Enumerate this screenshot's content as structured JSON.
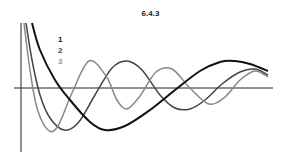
{
  "chart_data": {
    "type": "line",
    "title": "6.4.3",
    "xlabel": "",
    "ylabel": "",
    "grid": false,
    "legend_position": "upper-left (inside plot)",
    "axes": {
      "y_axis": {
        "x": 21,
        "y_top": 23,
        "y_bottom": 152
      },
      "x_axis": {
        "y": 88,
        "x_left": 14,
        "x_right": 273
      }
    },
    "series": [
      {
        "name": "1",
        "color": "#111111",
        "stroke_width": 2,
        "description": "decays from +inf near origin, one deep minimum, then broad positive hump",
        "points": [
          [
            32,
            23
          ],
          [
            40,
            50
          ],
          [
            55,
            80
          ],
          [
            70,
            100
          ],
          [
            90,
            122
          ],
          [
            105,
            130
          ],
          [
            125,
            126
          ],
          [
            150,
            110
          ],
          [
            175,
            90
          ],
          [
            200,
            71
          ],
          [
            220,
            62
          ],
          [
            235,
            61
          ],
          [
            250,
            64
          ],
          [
            268,
            71
          ]
        ]
      },
      {
        "name": "2",
        "color": "#444444",
        "stroke_width": 1.5,
        "description": "decays from +inf, minimum, then oscillates with decaying amplitude",
        "points": [
          [
            26,
            23
          ],
          [
            32,
            60
          ],
          [
            40,
            95
          ],
          [
            50,
            118
          ],
          [
            64,
            130
          ],
          [
            78,
            123
          ],
          [
            95,
            95
          ],
          [
            112,
            68
          ],
          [
            127,
            61
          ],
          [
            142,
            70
          ],
          [
            160,
            95
          ],
          [
            175,
            108
          ],
          [
            190,
            109
          ],
          [
            205,
            100
          ],
          [
            222,
            84
          ],
          [
            240,
            72
          ],
          [
            255,
            69
          ],
          [
            268,
            75
          ]
        ]
      },
      {
        "name": "3",
        "color": "#888888",
        "stroke_width": 1.5,
        "description": "fastest decay from +inf, highest oscillation frequency",
        "points": [
          [
            24,
            23
          ],
          [
            30,
            70
          ],
          [
            37,
            108
          ],
          [
            48,
            130
          ],
          [
            58,
            126
          ],
          [
            72,
            93
          ],
          [
            89,
            61
          ],
          [
            106,
            76
          ],
          [
            117,
            100
          ],
          [
            127,
            109
          ],
          [
            140,
            96
          ],
          [
            156,
            72
          ],
          [
            172,
            69
          ],
          [
            190,
            88
          ],
          [
            209,
            104
          ],
          [
            225,
            97
          ],
          [
            240,
            80
          ],
          [
            255,
            71
          ],
          [
            268,
            77
          ]
        ]
      }
    ]
  },
  "legend": {
    "items": [
      {
        "label": "1",
        "color": "#111111"
      },
      {
        "label": "2",
        "color": "#444444"
      },
      {
        "label": "3",
        "color": "#999999"
      }
    ]
  }
}
